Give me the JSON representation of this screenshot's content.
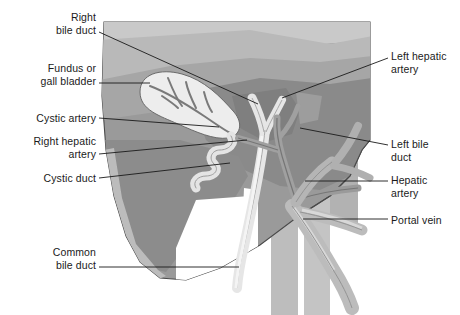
{
  "figure": {
    "background_color": "#ffffff"
  },
  "palette": {
    "liver_top_light": "#c9c9c9",
    "liver_top_mid": "#b4b4b4",
    "liver_mid": "#9a9a9a",
    "liver_dark": "#808080",
    "liver_lower_lobe": "#8c8c8c",
    "liver_rim": "#b8b8b8",
    "duct_pale": "#e2e2e2",
    "duct_light": "#d3d3d3",
    "vessel_gray": "#a8a8a8",
    "vessel_dark": "#8f8f8f",
    "vein_column": "#bdbdbd",
    "gallbladder_fill": "#ededed",
    "outline": "#4a4a4a",
    "leader_line": "#1a1a1a",
    "text": "#1a1a1a"
  },
  "labels_left": [
    {
      "name": "right-bile-duct",
      "lines": [
        "Right",
        "bile duct"
      ],
      "text": "Right\nbile duct",
      "x": 18,
      "y": 11,
      "width": 78,
      "leader": {
        "x1": 99,
        "y1": 32,
        "x2": 258,
        "y2": 104
      }
    },
    {
      "name": "fundus-or-gall-bladder",
      "lines": [
        "Fundus or",
        "gall bladder"
      ],
      "text": "Fundus or\ngall bladder",
      "x": 10,
      "y": 62,
      "width": 86,
      "leader": {
        "x1": 99,
        "y1": 83,
        "x2": 150,
        "y2": 83
      }
    },
    {
      "name": "cystic-artery",
      "lines": [
        "Cystic artery"
      ],
      "text": "Cystic artery",
      "x": 14,
      "y": 112,
      "width": 82,
      "leader": {
        "x1": 99,
        "y1": 118,
        "x2": 219,
        "y2": 127
      }
    },
    {
      "name": "right-hepatic-artery",
      "lines": [
        "Right hepatic",
        "artery"
      ],
      "text": "Right hepatic\nartery",
      "x": 8,
      "y": 135,
      "width": 88,
      "leader": {
        "x1": 99,
        "y1": 154,
        "x2": 247,
        "y2": 140
      }
    },
    {
      "name": "cystic-duct",
      "lines": [
        "Cystic duct"
      ],
      "text": "Cystic duct",
      "x": 20,
      "y": 172,
      "width": 76,
      "leader": {
        "x1": 99,
        "y1": 178,
        "x2": 230,
        "y2": 163
      }
    },
    {
      "name": "common-bile-duct",
      "lines": [
        "Common",
        "bile duct"
      ],
      "text": "Common\nbile duct",
      "x": 20,
      "y": 246,
      "width": 76,
      "leader": {
        "x1": 99,
        "y1": 267,
        "x2": 239,
        "y2": 267
      }
    }
  ],
  "labels_right": [
    {
      "name": "left-hepatic-artery",
      "lines": [
        "Left hepatic",
        "artery"
      ],
      "text": "Left hepatic\nartery",
      "x": 391,
      "y": 50,
      "width": 66,
      "leader": {
        "x1": 388,
        "y1": 58,
        "x2": 282,
        "y2": 98
      }
    },
    {
      "name": "left-bile-duct",
      "lines": [
        "Left bile",
        "duct"
      ],
      "text": "Left bile\nduct",
      "x": 391,
      "y": 138,
      "width": 66,
      "leader": {
        "x1": 388,
        "y1": 145,
        "x2": 300,
        "y2": 128
      }
    },
    {
      "name": "hepatic-artery",
      "lines": [
        "Hepatic",
        "artery"
      ],
      "text": "Hepatic\nartery",
      "x": 391,
      "y": 174,
      "width": 66,
      "leader": {
        "x1": 388,
        "y1": 181,
        "x2": 305,
        "y2": 181
      }
    },
    {
      "name": "portal-vein",
      "lines": [
        "Portal vein"
      ],
      "text": "Portal vein",
      "x": 391,
      "y": 214,
      "width": 66,
      "leader": {
        "x1": 388,
        "y1": 219,
        "x2": 303,
        "y2": 219
      }
    }
  ]
}
